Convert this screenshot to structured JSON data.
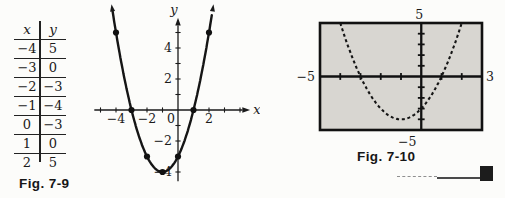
{
  "fig79": {
    "caption": "Fig. 7-9"
  },
  "fig710": {
    "caption": "Fig. 7-10"
  },
  "ink_color": "#1a1a1a",
  "chart_data": [
    {
      "type": "table",
      "title": "Fig. 7-9 table of values",
      "columns": [
        "x",
        "y"
      ],
      "rows": [
        [
          -4,
          5
        ],
        [
          -3,
          0
        ],
        [
          -2,
          -3
        ],
        [
          -1,
          -4
        ],
        [
          0,
          -3
        ],
        [
          1,
          0
        ],
        [
          2,
          5
        ]
      ]
    },
    {
      "type": "line",
      "title": "Hand-drawn parabola through the table points (Fig. 7-9)",
      "xlabel": "x",
      "ylabel": "y",
      "curve": {
        "kind": "quadratic",
        "a": 1,
        "b": 2,
        "c": -3,
        "x_start": -4.22,
        "x_end": 2.22
      },
      "points": [
        [
          -4,
          5
        ],
        [
          -3,
          0
        ],
        [
          -2,
          -3
        ],
        [
          -1,
          -4
        ],
        [
          0,
          -3
        ],
        [
          1,
          0
        ],
        [
          2,
          5
        ]
      ],
      "x_tick_range": [
        -5,
        4
      ],
      "y_tick_range": [
        -4,
        5
      ],
      "x_tick_labels": [
        -4,
        -2,
        0,
        2
      ],
      "y_tick_labels": [
        -4,
        -2,
        2,
        4
      ],
      "xlim": [
        -5.4,
        4.6
      ],
      "ylim": [
        -4.6,
        5.9
      ],
      "grid": false,
      "legend": false
    },
    {
      "type": "line",
      "title": "Graphing-calculator view of same parabola (Fig. 7-10)",
      "style": "dashed",
      "curve": {
        "kind": "quadratic",
        "a": 1,
        "b": 2,
        "c": -3,
        "x_start": -4,
        "x_end": 2
      },
      "window": {
        "xmin": -5,
        "xmax": 3,
        "ymin": -5,
        "ymax": 5
      },
      "edge_labels": {
        "top": "5",
        "left": "-5",
        "right": "3",
        "bottom": "-5"
      },
      "screen_fill": "#d8d6d1",
      "grid": false,
      "legend": false
    }
  ]
}
